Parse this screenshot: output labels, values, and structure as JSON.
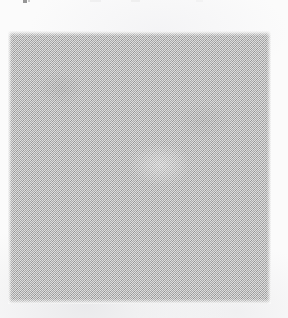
{
  "page": {
    "kind": "scanned-page-fragment",
    "width": 288,
    "height": 318,
    "background_color": "#fbfbfb",
    "visible_text": "",
    "note": ""
  },
  "figure": {
    "name": "gray-halftone-block",
    "label": "",
    "caption": "",
    "fill_color": "#a9a9a9",
    "pattern": "checkerboard-dither",
    "x": 8,
    "y": 31,
    "width": 263,
    "height": 273
  },
  "artifacts": {
    "top_edge_specks": [
      {
        "x": 23,
        "width": 4,
        "color": "#6f6f6f"
      },
      {
        "x": 28,
        "width": 2,
        "color": "#6f6f6f"
      },
      {
        "x": 90,
        "width": 11,
        "color": "#b6b6b6"
      },
      {
        "x": 131,
        "width": 9,
        "color": "#b6b6b6"
      },
      {
        "x": 196,
        "width": 7,
        "color": "#c2c2c2"
      }
    ]
  }
}
